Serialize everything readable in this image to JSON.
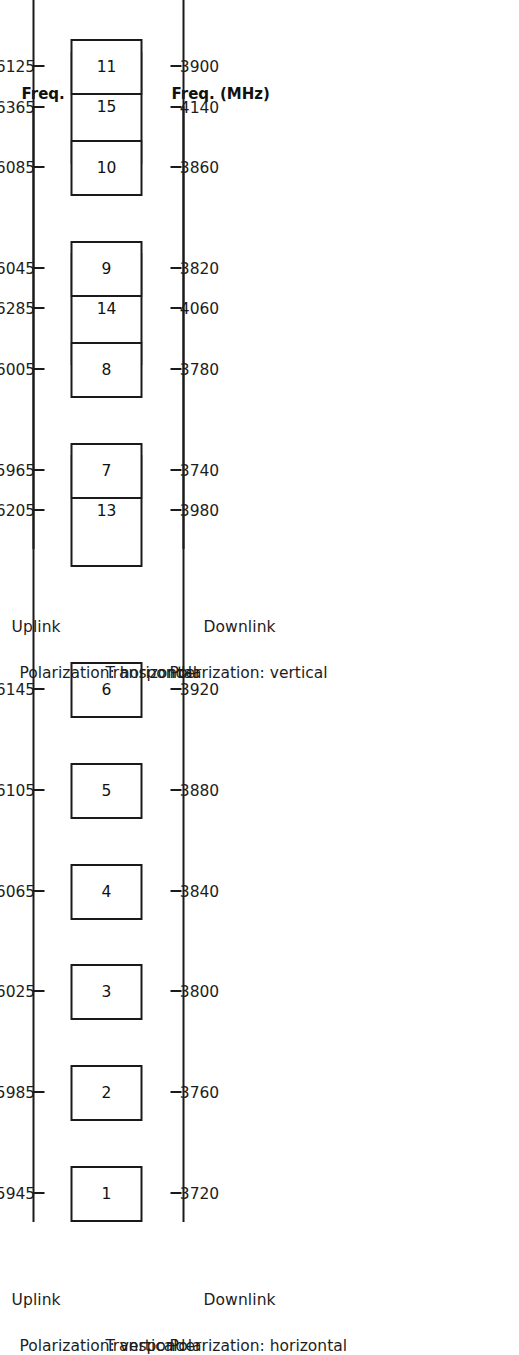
{
  "figure": {
    "type": "satellite-transponder-frequency-plan",
    "freq_axis_caption": "Freq. (MHz)",
    "transponder_row_label": "Transponder",
    "uplink_label": "Uplink",
    "downlink_label": "Downlink",
    "line_color": "#1a1a1a"
  },
  "panels": [
    {
      "id": "panel-a",
      "uplink_label": "Uplink",
      "downlink_label": "Downlink",
      "uplink_caption": "Freq. (MHz)",
      "downlink_caption": "Freq. (MHz)",
      "uplink_polarization": "Polarization:  vertical",
      "downlink_polarization": "Polarization:  horizontal",
      "transponder_label": "Transponder",
      "transponders": [
        {
          "id": "1",
          "uplink": "5945",
          "downlink": "3720",
          "wide": false
        },
        {
          "id": "2",
          "uplink": "5985",
          "downlink": "3760",
          "wide": false
        },
        {
          "id": "3",
          "uplink": "6025",
          "downlink": "3800",
          "wide": false
        },
        {
          "id": "4",
          "uplink": "6065",
          "downlink": "3840",
          "wide": false
        },
        {
          "id": "5",
          "uplink": "6105",
          "downlink": "3880",
          "wide": false
        },
        {
          "id": "6",
          "uplink": "6145",
          "downlink": "3920",
          "wide": false
        },
        {
          "id": "13",
          "uplink": "6205",
          "downlink": "3980",
          "wide": true
        },
        {
          "id": "14",
          "uplink": "6285",
          "downlink": "4060",
          "wide": true
        },
        {
          "id": "15",
          "uplink": "6365",
          "downlink": "4140",
          "wide": true
        }
      ]
    },
    {
      "id": "panel-b",
      "uplink_label": "Uplink",
      "downlink_label": "Downlink",
      "uplink_caption": "Freq. (MHz)",
      "downlink_caption": "Freq. (MHz)",
      "uplink_polarization": "Polarization:  horizontal",
      "downlink_polarization": "Polarization:  vertical",
      "transponder_label": "Transponder",
      "transponders": [
        {
          "id": "7",
          "uplink": "5965",
          "downlink": "3740",
          "wide": false
        },
        {
          "id": "8",
          "uplink": "6005",
          "downlink": "3780",
          "wide": false
        },
        {
          "id": "9",
          "uplink": "6045",
          "downlink": "3820",
          "wide": false
        },
        {
          "id": "10",
          "uplink": "6085",
          "downlink": "3860",
          "wide": false
        },
        {
          "id": "11",
          "uplink": "6125",
          "downlink": "3900",
          "wide": false
        },
        {
          "id": "12",
          "uplink": "6165",
          "downlink": "3940",
          "wide": false
        },
        {
          "id": "16",
          "uplink": "6225",
          "downlink": "4000",
          "wide": true
        },
        {
          "id": "17",
          "uplink": "6305",
          "downlink": "4080",
          "wide": true
        },
        {
          "id": "18",
          "uplink": "6385",
          "downlink": "4160",
          "wide": true
        }
      ]
    }
  ],
  "chart_data": {
    "type": "table",
    "columns": [
      "Transponder",
      "Uplink Freq. (MHz)",
      "Downlink Freq. (MHz)",
      "Uplink polarization",
      "Downlink polarization"
    ],
    "rows": [
      [
        "1",
        "5945",
        "3720",
        "vertical",
        "horizontal"
      ],
      [
        "2",
        "5985",
        "3760",
        "vertical",
        "horizontal"
      ],
      [
        "3",
        "6025",
        "3800",
        "vertical",
        "horizontal"
      ],
      [
        "4",
        "6065",
        "3840",
        "vertical",
        "horizontal"
      ],
      [
        "5",
        "6105",
        "3880",
        "vertical",
        "horizontal"
      ],
      [
        "6",
        "6145",
        "3920",
        "vertical",
        "horizontal"
      ],
      [
        "13",
        "6205",
        "3980",
        "vertical",
        "horizontal"
      ],
      [
        "14",
        "6285",
        "4060",
        "vertical",
        "horizontal"
      ],
      [
        "15",
        "6365",
        "4140",
        "vertical",
        "horizontal"
      ],
      [
        "7",
        "5965",
        "3740",
        "horizontal",
        "vertical"
      ],
      [
        "8",
        "6005",
        "3780",
        "horizontal",
        "vertical"
      ],
      [
        "9",
        "6045",
        "3820",
        "horizontal",
        "vertical"
      ],
      [
        "10",
        "6085",
        "3860",
        "horizontal",
        "vertical"
      ],
      [
        "11",
        "6125",
        "3900",
        "horizontal",
        "vertical"
      ],
      [
        "12",
        "6165",
        "3940",
        "horizontal",
        "vertical"
      ],
      [
        "16",
        "6225",
        "4000",
        "horizontal",
        "vertical"
      ],
      [
        "17",
        "6305",
        "4080",
        "horizontal",
        "vertical"
      ],
      [
        "18",
        "6385",
        "4160",
        "horizontal",
        "vertical"
      ]
    ],
    "xlabel": "Freq. (MHz)",
    "ylabel": ""
  }
}
